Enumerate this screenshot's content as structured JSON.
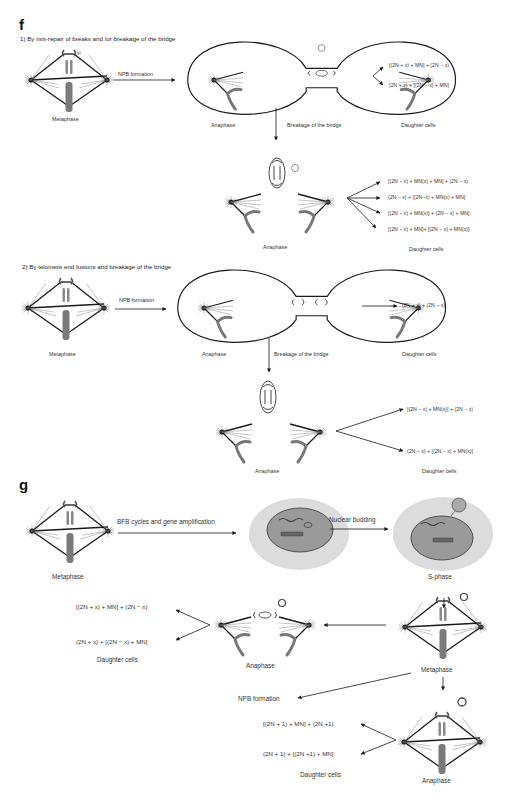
{
  "panel_f": {
    "letter": "f",
    "section1": {
      "title": "1) By mis-repair of breaks and /or breakage of the bridge",
      "metaphase_label": "Metaphase",
      "chromosome_tag": "x²",
      "arrow_label": "NPB formation",
      "anaphase_label": "Anaphase",
      "bridge_label": "Breakage of the bridge",
      "daughter_label": "Daughter cells",
      "outcomes": [
        "[(2N + x) + MN] + (2N − x)",
        "(2N + x) + [(2N − x) + MN]"
      ],
      "sub_anaphase_label": "Anaphase",
      "sub_daughter_label": "Daughter cells",
      "sub_outcomes": [
        "[(2N − x) + MN(x) + MN] + (2N − x)",
        "(2N − x) + [(2N−x) + MN(x) + MN]",
        "[(2N − x) + MN(x)] + (2N − x) + MN]",
        "[(2N − x) + MN]+ [(2N − x) + MN(x)]"
      ]
    },
    "section2": {
      "title": "2) By telomere end fusions and breakage of the bridge",
      "metaphase_label": "Metaphase",
      "arrow_label": "NPB formation",
      "anaphase_label": "Anaphase",
      "bridge_label": "Breakage of the bridge",
      "daughter_label": "Daughter cells",
      "outcome": "(2N + x) + (2N − x)",
      "sub_anaphase_label": "Anaphase",
      "sub_daughter_label": "Daughter cells",
      "sub_outcomes": [
        "[(2N − x) + MN(x)] + (2N − x)",
        "(2N − x) + [(2N − x) + MN(x)]"
      ]
    }
  },
  "panel_g": {
    "letter": "g",
    "metaphase_label": "Metaphase",
    "bfb_label": "BFB cycles and gene amplification",
    "budding_label": "Nuclear budding",
    "sphase_label": "S-phase",
    "metaphase2_label": "Metaphase",
    "anaphase_label": "Anaphase",
    "daughter_label": "Daughter cells",
    "outcomes": [
      "[(2N + x) + MN] + (2N − x)",
      "(2N + x) + [(2N − x) + MN]"
    ],
    "npb_label": "NPB formation",
    "anaphase2_label": "Anaphase",
    "daughter2_label": "Daughter cells",
    "outcomes2": [
      "[(2N + 1) + MN] + (2N +1)",
      "(2N + 1) + [(2N +1) + MN]"
    ]
  },
  "colors": {
    "line": "#1a1a1a",
    "chromosome": "#7a7a7a",
    "cell_fill": "#dcdcdc",
    "nucleus_fill": "#9a9a9a"
  }
}
